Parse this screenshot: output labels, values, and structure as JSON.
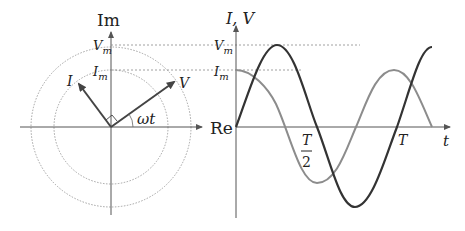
{
  "phasor_diagram": {
    "axis_labels": {
      "imag": "Im",
      "real": "Re"
    },
    "phasor_labels": {
      "current": "I",
      "voltage": "V"
    },
    "magnitude_labels": {
      "vm_main": "V",
      "vm_sub": "m",
      "im_main": "I",
      "im_sub": "m"
    },
    "angle_label": "ωt",
    "right_angle_marker": true
  },
  "waveform_graph": {
    "y_axis_label": "I, V",
    "x_axis_label": "t",
    "magnitude_labels": {
      "vm_main": "V",
      "vm_sub": "m",
      "im_main": "I",
      "im_sub": "m"
    },
    "ticks": {
      "half_period_num": "T",
      "half_period_den": "2",
      "period": "T"
    }
  },
  "colors": {
    "axis": "#555555",
    "voltage": "#333333",
    "current": "#8c8c8c",
    "dashed": "#888888"
  }
}
